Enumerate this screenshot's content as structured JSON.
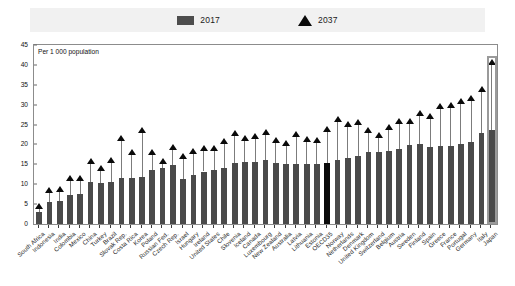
{
  "legend": {
    "series_2017": {
      "label": "2017",
      "icon": "bar-swatch-icon",
      "color": "#4d4d4d"
    },
    "series_2037": {
      "label": "2037",
      "icon": "triangle-marker-icon",
      "color": "#0a0a0a"
    }
  },
  "axis_note": "Per 1 000 population",
  "chart_data": {
    "type": "bar",
    "title": "",
    "subtitle": "",
    "xlabel": "",
    "ylabel": "Per 1 000 population",
    "ylim": [
      0,
      45
    ],
    "yticks": [
      0,
      5,
      10,
      15,
      20,
      25,
      30,
      35,
      40,
      45
    ],
    "grid": false,
    "legend_position": "top-center",
    "highlight_category": "OECD35",
    "highlight_box_category": "Japan",
    "categories": [
      "South Africa",
      "Indonesia",
      "India",
      "Colombia",
      "Mexico",
      "China",
      "Turkey",
      "Brazil",
      "Slovak Rep.",
      "Costa Rica",
      "Korea",
      "Poland",
      "Russian Fed.",
      "Czech Rep.",
      "Israel",
      "Hungary",
      "Ireland",
      "United States",
      "Chile",
      "Slovenia",
      "Iceland",
      "Canada",
      "Luxembourg",
      "New Zealand",
      "Australia",
      "Latvia",
      "Lithuania",
      "Estonia",
      "OECD35",
      "Norway",
      "Netherlands",
      "Denmark",
      "United Kingdom",
      "Switzerland",
      "Belgium",
      "Austria",
      "Sweden",
      "Finland",
      "Spain",
      "Greece",
      "France",
      "Portugal",
      "Germany",
      "Italy",
      "Japan"
    ],
    "series": [
      {
        "name": "2017",
        "type": "bar",
        "values": [
          3.0,
          5.5,
          5.8,
          7.2,
          7.5,
          10.5,
          10.3,
          10.6,
          11.5,
          11.6,
          11.7,
          13.5,
          14.0,
          14.8,
          11.2,
          12.2,
          13.2,
          13.6,
          14.0,
          15.3,
          15.5,
          15.6,
          16.0,
          15.3,
          15.0,
          15.2,
          15.2,
          15.2,
          15.4,
          16.2,
          16.6,
          17.2,
          18.0,
          18.1,
          18.4,
          18.8,
          19.8,
          20.0,
          19.3,
          19.5,
          19.6,
          20.0,
          20.6,
          22.8,
          23.6
        ]
      },
      {
        "name": "2037",
        "type": "scatter-triangle",
        "values": [
          4.5,
          8.6,
          8.8,
          11.5,
          11.6,
          15.8,
          14.0,
          16.0,
          21.5,
          18.2,
          23.6,
          18.0,
          15.8,
          19.3,
          17.0,
          18.4,
          19.0,
          19.2,
          20.8,
          23.0,
          21.5,
          22.0,
          23.2,
          21.2,
          20.4,
          22.6,
          21.3,
          21.2,
          24.0,
          26.5,
          25.2,
          25.7,
          23.6,
          22.5,
          24.4,
          25.9,
          26.0,
          27.8,
          27.2,
          29.6,
          30.0,
          31.0,
          31.8,
          34.0,
          40.8
        ]
      }
    ]
  }
}
